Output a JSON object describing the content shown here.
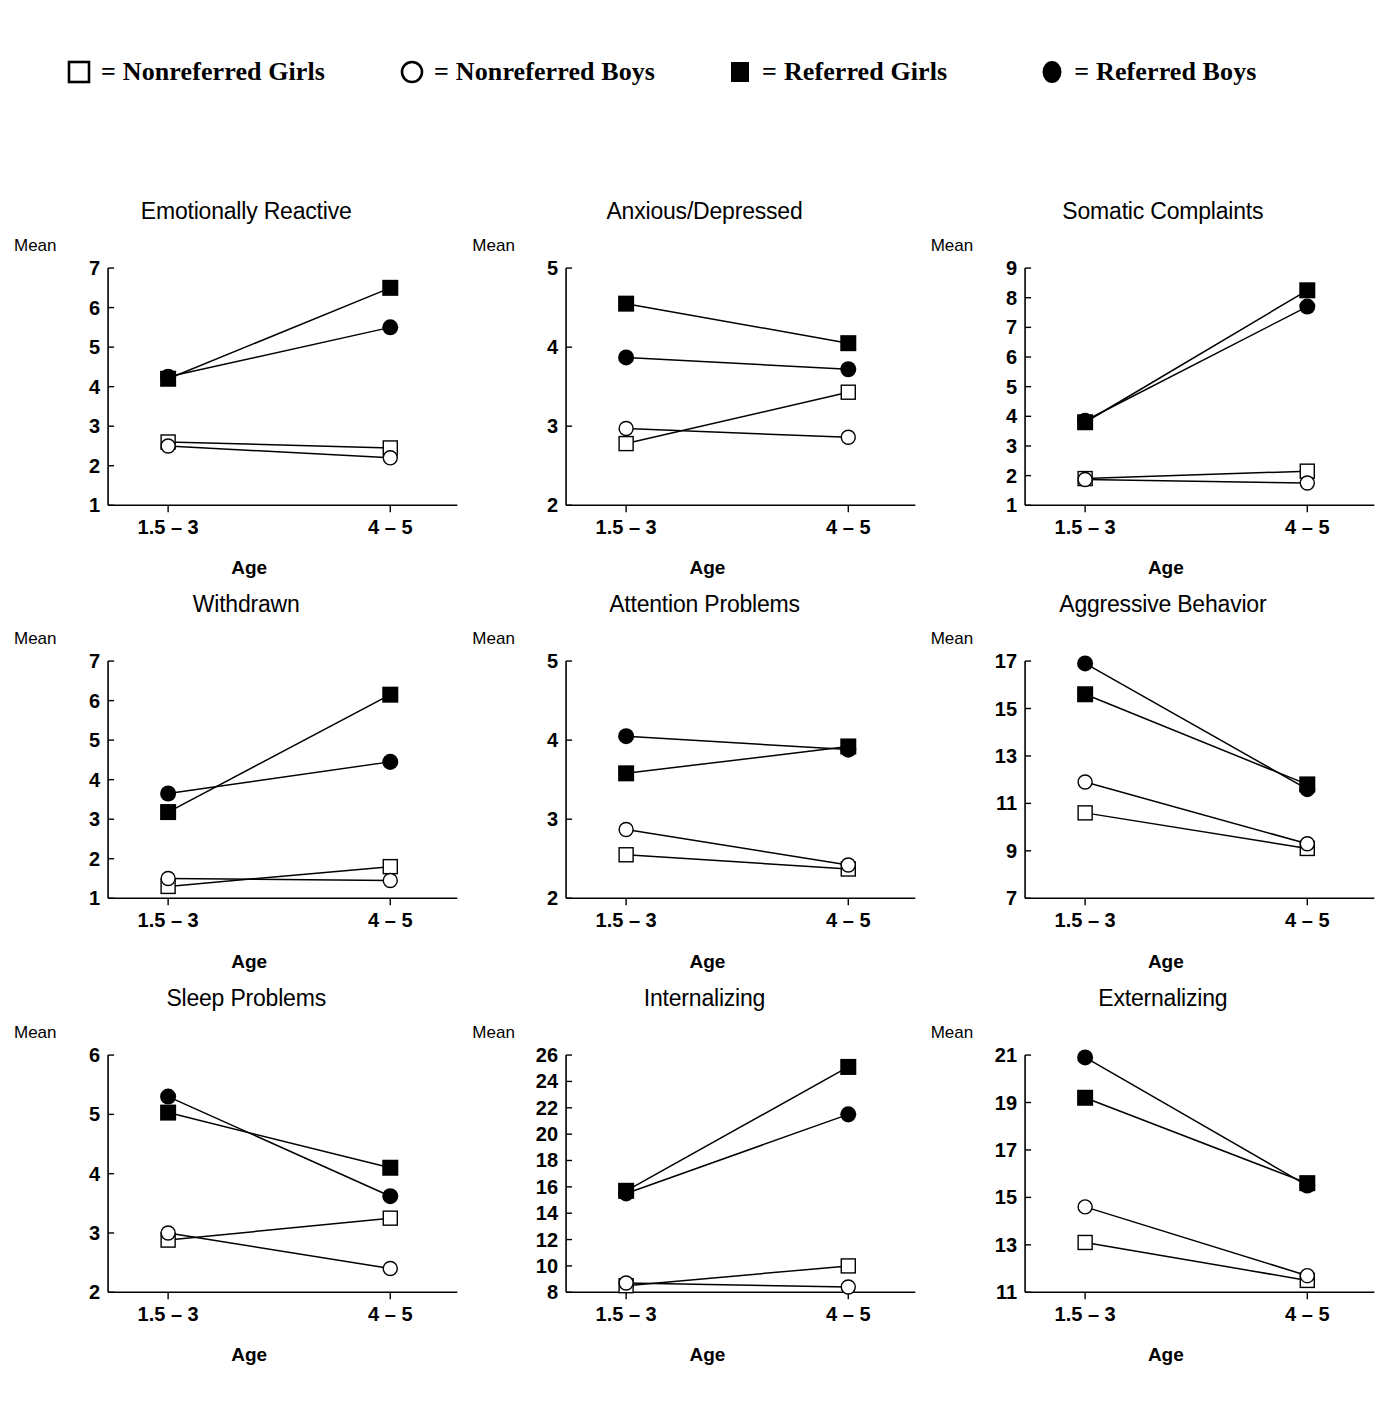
{
  "legend": {
    "items": [
      {
        "marker": "open-square-marker",
        "equals": "=",
        "label": "Nonreferred Girls"
      },
      {
        "marker": "open-circle-marker",
        "equals": "=",
        "label": "Nonreferred Boys"
      },
      {
        "marker": "filled-square-marker",
        "equals": "=",
        "label": "Referred Girls"
      },
      {
        "marker": "filled-circle-marker",
        "equals": "=",
        "label": "Referred Boys"
      }
    ]
  },
  "common": {
    "mean_label": "Mean",
    "x_axis_label": "Age",
    "categories": [
      "1.5 – 3",
      "4 – 5"
    ],
    "series_names": [
      "Nonreferred Girls",
      "Nonreferred Boys",
      "Referred Girls",
      "Referred Boys"
    ],
    "line_color": "#000000"
  },
  "chart_data": [
    {
      "type": "line",
      "title": "Emotionally Reactive",
      "xlabel": "Age",
      "ylabel": "Mean",
      "categories": [
        "1.5 – 3",
        "4 – 5"
      ],
      "ylim": [
        1,
        7
      ],
      "yticks": [
        1,
        2,
        3,
        4,
        5,
        6,
        7
      ],
      "grid": false,
      "legend_position": "top",
      "series": [
        {
          "name": "Nonreferred Girls",
          "marker": "open-square",
          "values": [
            2.6,
            2.45
          ]
        },
        {
          "name": "Nonreferred Boys",
          "marker": "open-circle",
          "values": [
            2.5,
            2.2
          ]
        },
        {
          "name": "Referred Girls",
          "marker": "filled-square",
          "values": [
            4.2,
            6.5
          ]
        },
        {
          "name": "Referred Boys",
          "marker": "filled-circle",
          "values": [
            4.25,
            5.5
          ]
        }
      ]
    },
    {
      "type": "line",
      "title": "Anxious/Depressed",
      "xlabel": "Age",
      "ylabel": "Mean",
      "categories": [
        "1.5 – 3",
        "4 – 5"
      ],
      "ylim": [
        2,
        5
      ],
      "yticks": [
        2,
        3,
        4,
        5
      ],
      "grid": false,
      "legend_position": "top",
      "series": [
        {
          "name": "Nonreferred Girls",
          "marker": "open-square",
          "values": [
            2.78,
            3.43
          ]
        },
        {
          "name": "Nonreferred Boys",
          "marker": "open-circle",
          "values": [
            2.97,
            2.86
          ]
        },
        {
          "name": "Referred Girls",
          "marker": "filled-square",
          "values": [
            4.55,
            4.05
          ]
        },
        {
          "name": "Referred Boys",
          "marker": "filled-circle",
          "values": [
            3.87,
            3.72
          ]
        }
      ]
    },
    {
      "type": "line",
      "title": "Somatic Complaints",
      "xlabel": "Age",
      "ylabel": "Mean",
      "categories": [
        "1.5 – 3",
        "4 – 5"
      ],
      "ylim": [
        1,
        9
      ],
      "yticks": [
        1,
        2,
        3,
        4,
        5,
        6,
        7,
        8,
        9
      ],
      "grid": false,
      "legend_position": "top",
      "series": [
        {
          "name": "Nonreferred Girls",
          "marker": "open-square",
          "values": [
            1.9,
            2.15
          ]
        },
        {
          "name": "Nonreferred Boys",
          "marker": "open-circle",
          "values": [
            1.87,
            1.75
          ]
        },
        {
          "name": "Referred Girls",
          "marker": "filled-square",
          "values": [
            3.8,
            8.25
          ]
        },
        {
          "name": "Referred Boys",
          "marker": "filled-circle",
          "values": [
            3.85,
            7.7
          ]
        }
      ]
    },
    {
      "type": "line",
      "title": "Withdrawn",
      "xlabel": "Age",
      "ylabel": "Mean",
      "categories": [
        "1.5 – 3",
        "4 – 5"
      ],
      "ylim": [
        1,
        7
      ],
      "yticks": [
        1,
        2,
        3,
        4,
        5,
        6,
        7
      ],
      "grid": false,
      "legend_position": "top",
      "series": [
        {
          "name": "Nonreferred Girls",
          "marker": "open-square",
          "values": [
            1.3,
            1.8
          ]
        },
        {
          "name": "Nonreferred Boys",
          "marker": "open-circle",
          "values": [
            1.5,
            1.45
          ]
        },
        {
          "name": "Referred Girls",
          "marker": "filled-square",
          "values": [
            3.18,
            6.15
          ]
        },
        {
          "name": "Referred Boys",
          "marker": "filled-circle",
          "values": [
            3.65,
            4.45
          ]
        }
      ]
    },
    {
      "type": "line",
      "title": "Attention Problems",
      "xlabel": "Age",
      "ylabel": "Mean",
      "categories": [
        "1.5 – 3",
        "4 – 5"
      ],
      "ylim": [
        2,
        5
      ],
      "yticks": [
        2,
        3,
        4,
        5
      ],
      "grid": false,
      "legend_position": "top",
      "series": [
        {
          "name": "Nonreferred Girls",
          "marker": "open-square",
          "values": [
            2.55,
            2.37
          ]
        },
        {
          "name": "Nonreferred Boys",
          "marker": "open-circle",
          "values": [
            2.87,
            2.42
          ]
        },
        {
          "name": "Referred Girls",
          "marker": "filled-square",
          "values": [
            3.58,
            3.92
          ]
        },
        {
          "name": "Referred Boys",
          "marker": "filled-circle",
          "values": [
            4.05,
            3.88
          ]
        }
      ]
    },
    {
      "type": "line",
      "title": "Aggressive Behavior",
      "xlabel": "Age",
      "ylabel": "Mean",
      "categories": [
        "1.5 – 3",
        "4 – 5"
      ],
      "ylim": [
        7,
        17
      ],
      "yticks": [
        7,
        9,
        11,
        13,
        15,
        17
      ],
      "grid": false,
      "legend_position": "top",
      "series": [
        {
          "name": "Nonreferred Girls",
          "marker": "open-square",
          "values": [
            10.6,
            9.1
          ]
        },
        {
          "name": "Nonreferred Boys",
          "marker": "open-circle",
          "values": [
            11.9,
            9.3
          ]
        },
        {
          "name": "Referred Girls",
          "marker": "filled-square",
          "values": [
            15.6,
            11.8
          ]
        },
        {
          "name": "Referred Boys",
          "marker": "filled-circle",
          "values": [
            16.9,
            11.6
          ]
        }
      ]
    },
    {
      "type": "line",
      "title": "Sleep Problems",
      "xlabel": "Age",
      "ylabel": "Mean",
      "categories": [
        "1.5 – 3",
        "4 – 5"
      ],
      "ylim": [
        2,
        6
      ],
      "yticks": [
        2,
        3,
        4,
        5,
        6
      ],
      "grid": false,
      "legend_position": "top",
      "series": [
        {
          "name": "Nonreferred Girls",
          "marker": "open-square",
          "values": [
            2.88,
            3.25
          ]
        },
        {
          "name": "Nonreferred Boys",
          "marker": "open-circle",
          "values": [
            3.0,
            2.4
          ]
        },
        {
          "name": "Referred Girls",
          "marker": "filled-square",
          "values": [
            5.03,
            4.1
          ]
        },
        {
          "name": "Referred Boys",
          "marker": "filled-circle",
          "values": [
            5.3,
            3.62
          ]
        }
      ]
    },
    {
      "type": "line",
      "title": "Internalizing",
      "xlabel": "Age",
      "ylabel": "Mean",
      "categories": [
        "1.5 – 3",
        "4 – 5"
      ],
      "ylim": [
        8,
        26
      ],
      "yticks": [
        8,
        10,
        12,
        14,
        16,
        18,
        20,
        22,
        24,
        26
      ],
      "grid": false,
      "legend_position": "top",
      "series": [
        {
          "name": "Nonreferred Girls",
          "marker": "open-square",
          "values": [
            8.5,
            10.0
          ]
        },
        {
          "name": "Nonreferred Boys",
          "marker": "open-circle",
          "values": [
            8.7,
            8.4
          ]
        },
        {
          "name": "Referred Girls",
          "marker": "filled-square",
          "values": [
            15.7,
            25.1
          ]
        },
        {
          "name": "Referred Boys",
          "marker": "filled-circle",
          "values": [
            15.5,
            21.5
          ]
        }
      ]
    },
    {
      "type": "line",
      "title": "Externalizing",
      "xlabel": "Age",
      "ylabel": "Mean",
      "categories": [
        "1.5 – 3",
        "4 – 5"
      ],
      "ylim": [
        11,
        21
      ],
      "yticks": [
        11,
        13,
        15,
        17,
        19,
        21
      ],
      "grid": false,
      "legend_position": "top",
      "series": [
        {
          "name": "Nonreferred Girls",
          "marker": "open-square",
          "values": [
            13.1,
            11.5
          ]
        },
        {
          "name": "Nonreferred Boys",
          "marker": "open-circle",
          "values": [
            14.6,
            11.7
          ]
        },
        {
          "name": "Referred Girls",
          "marker": "filled-square",
          "values": [
            19.2,
            15.6
          ]
        },
        {
          "name": "Referred Boys",
          "marker": "filled-circle",
          "values": [
            20.9,
            15.5
          ]
        }
      ]
    }
  ]
}
